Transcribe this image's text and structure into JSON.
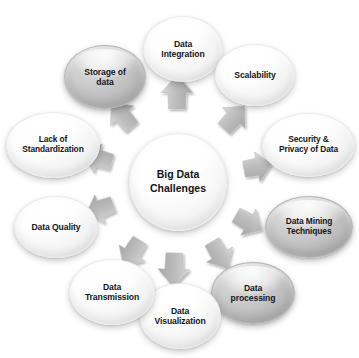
{
  "diagram": {
    "title": "Big Data Challenges",
    "type": "radial hub and spoke",
    "background_color": "#ffffff",
    "text_color": "#14161c",
    "arrow_color": "#b5b5b5",
    "shaded_node_color": "#c1c1c1",
    "light_node_color": "#fdfdfd",
    "hub": {
      "label": "Big Data\nChallenges"
    },
    "nodes": [
      {
        "id": "data-integration",
        "label": "Data\nIntegration",
        "style": "light",
        "position": "top",
        "angle_deg": 270,
        "x": 143,
        "y": 16,
        "w": 80,
        "h": 66,
        "font_size": 8.6
      },
      {
        "id": "scalability",
        "label": "Scalability",
        "style": "light",
        "position": "top-right",
        "angle_deg": 314,
        "x": 215,
        "y": 44,
        "w": 80,
        "h": 62,
        "font_size": 8.6
      },
      {
        "id": "security-privacy-of-data",
        "label": "Security &\nPrivacy of Data",
        "style": "light",
        "position": "right",
        "angle_deg": 350,
        "x": 262,
        "y": 113,
        "w": 93,
        "h": 64,
        "font_size": 8.4
      },
      {
        "id": "data-mining-techniques",
        "label": "Data Mining\nTechniques",
        "style": "shaded",
        "position": "lower-right",
        "angle_deg": 32,
        "x": 265,
        "y": 196,
        "w": 88,
        "h": 62,
        "font_size": 8.4
      },
      {
        "id": "data-processing",
        "label": "Data\nprocessing",
        "style": "shaded",
        "position": "bottom-right",
        "angle_deg": 62,
        "x": 211,
        "y": 262,
        "w": 84,
        "h": 62,
        "font_size": 8.6
      },
      {
        "id": "data-visualization",
        "label": "Data\nVisualization",
        "style": "light",
        "position": "bottom",
        "angle_deg": 92,
        "x": 139,
        "y": 283,
        "w": 82,
        "h": 66,
        "font_size": 8.6
      },
      {
        "id": "data-transmission",
        "label": "Data\nTransmission",
        "style": "light",
        "position": "bottom-left",
        "angle_deg": 122,
        "x": 69,
        "y": 259,
        "w": 86,
        "h": 66,
        "font_size": 8.6
      },
      {
        "id": "data-quality",
        "label": "Data Quality",
        "style": "light",
        "position": "left",
        "angle_deg": 160,
        "x": 14,
        "y": 196,
        "w": 84,
        "h": 62,
        "font_size": 8.6
      },
      {
        "id": "lack-of-standardization",
        "label": "Lack of\nStandardization",
        "style": "light",
        "position": "upper-left",
        "angle_deg": 196,
        "x": 6,
        "y": 112,
        "w": 94,
        "h": 66,
        "font_size": 8.4
      },
      {
        "id": "storage-of-data",
        "label": "Storage of\ndata",
        "style": "shaded",
        "position": "top-left",
        "angle_deg": 228,
        "x": 64,
        "y": 45,
        "w": 82,
        "h": 64,
        "font_size": 8.6
      }
    ],
    "arrows": [
      {
        "id": "arrow-to-data-integration",
        "target": "data-integration",
        "angle_deg": 270,
        "radius": 72,
        "length": 34,
        "width": 20
      },
      {
        "id": "arrow-to-scalability",
        "target": "scalability",
        "angle_deg": 312,
        "radius": 70,
        "length": 31,
        "width": 19
      },
      {
        "id": "arrow-to-security-privacy",
        "target": "security-privacy-of-data",
        "angle_deg": 350,
        "radius": 68,
        "length": 28,
        "width": 19
      },
      {
        "id": "arrow-to-data-mining-techniques",
        "target": "data-mining-techniques",
        "angle_deg": 30,
        "radius": 68,
        "length": 30,
        "width": 19
      },
      {
        "id": "arrow-to-data-processing",
        "target": "data-processing",
        "angle_deg": 60,
        "radius": 70,
        "length": 31,
        "width": 19
      },
      {
        "id": "arrow-to-data-visualization",
        "target": "data-visualization",
        "angle_deg": 92,
        "radius": 72,
        "length": 34,
        "width": 20
      },
      {
        "id": "arrow-to-data-transmission",
        "target": "data-transmission",
        "angle_deg": 122,
        "radius": 70,
        "length": 31,
        "width": 19
      },
      {
        "id": "arrow-to-data-quality",
        "target": "data-quality",
        "angle_deg": 160,
        "radius": 68,
        "length": 29,
        "width": 19
      },
      {
        "id": "arrow-to-lack-of-standardization",
        "target": "lack-of-standardization",
        "angle_deg": 196,
        "radius": 68,
        "length": 29,
        "width": 19
      },
      {
        "id": "arrow-to-storage-of-data",
        "target": "storage-of-data",
        "angle_deg": 230,
        "radius": 70,
        "length": 32,
        "width": 19
      }
    ]
  }
}
